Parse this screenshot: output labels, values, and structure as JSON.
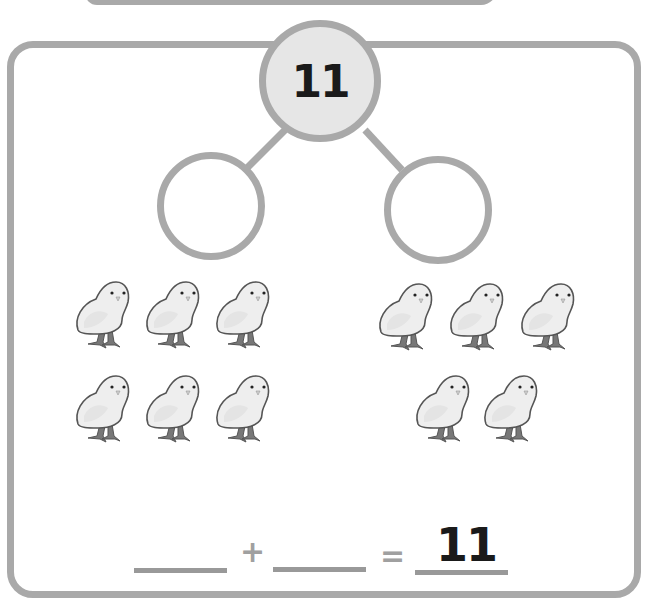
{
  "worksheet": {
    "number_bond": {
      "whole": "11",
      "part_left": "",
      "part_right": ""
    },
    "groups": {
      "left": {
        "label": "chicks-left-group",
        "count": 6,
        "rows": [
          3,
          3
        ]
      },
      "right": {
        "label": "chicks-right-group",
        "count": 5,
        "rows": [
          3,
          2
        ]
      }
    },
    "equation": {
      "addend_1": "",
      "plus": "+",
      "addend_2": "",
      "equals": "=",
      "sum": "11"
    },
    "icons": {
      "chick": "chick-icon"
    },
    "colors": {
      "border": "#a9a9a9",
      "whole_fill": "#e6e6e6",
      "text": "#1a1a1a",
      "chick_body": "#eeeeee",
      "chick_outline": "#555555",
      "chick_legs": "#777777"
    }
  }
}
